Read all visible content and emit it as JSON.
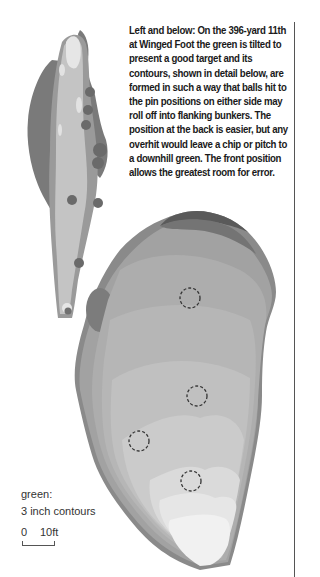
{
  "caption": {
    "text": "Left and below: On the 396-yard 11th at Winged Foot the green is tilted to present a good target and its contours, shown in detail below, are formed in such a way that balls hit to the pin positions on either side may roll off into flanking bunkers. The position at the back is easier, but any overhit would leave a chip or pitch to a downhill green. The front position allows the greatest room for error."
  },
  "legend": {
    "title": "green:",
    "subtitle": "3 inch contours"
  },
  "scale": {
    "zero": "0",
    "ten": "10ft"
  },
  "hole": {
    "yardage": 396,
    "number": "11th",
    "course": "Winged Foot"
  },
  "pins": [
    {
      "label": "back",
      "cx": 190,
      "cy": 298
    },
    {
      "label": "right",
      "cx": 197,
      "cy": 396
    },
    {
      "label": "left",
      "cx": 139,
      "cy": 441
    },
    {
      "label": "front",
      "cx": 191,
      "cy": 481
    }
  ],
  "colors": {
    "rough": "#7a7a7a",
    "fairway_edge": "#9a9a9a",
    "fairway": "#c4c4c4",
    "tee": "#e6e6e6",
    "contour_dark": "#6e6e6e",
    "contour_light": "#f4f4f4",
    "text": "#1a1a1a"
  }
}
